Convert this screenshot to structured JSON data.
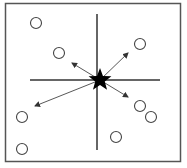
{
  "diagram": {
    "type": "radial-scatter",
    "frame": {
      "x": 5.5,
      "y": 3.5,
      "width": 175,
      "height": 158,
      "stroke": "#555555"
    },
    "axes": {
      "horizontal": {
        "x1": 30,
        "y1": 80,
        "x2": 160,
        "y2": 80
      },
      "vertical": {
        "x1": 97,
        "y1": 14,
        "x2": 97,
        "y2": 150
      },
      "stroke": "#333333"
    },
    "center": {
      "x": 100,
      "y": 80,
      "shape": "star-icon",
      "color": "#000000"
    },
    "points": [
      {
        "x": 36,
        "y": 23
      },
      {
        "x": 59,
        "y": 53
      },
      {
        "x": 140,
        "y": 44
      },
      {
        "x": 22,
        "y": 117
      },
      {
        "x": 22,
        "y": 149
      },
      {
        "x": 140,
        "y": 106
      },
      {
        "x": 151,
        "y": 117
      },
      {
        "x": 116,
        "y": 137
      }
    ],
    "arrows": [
      {
        "from": [
          100,
          80
        ],
        "to": [
          72,
          63
        ]
      },
      {
        "from": [
          100,
          80
        ],
        "to": [
          128,
          53
        ]
      },
      {
        "from": [
          100,
          80
        ],
        "to": [
          35,
          106
        ]
      },
      {
        "from": [
          100,
          80
        ],
        "to": [
          128,
          97
        ]
      }
    ],
    "point_radius": 5.5,
    "point_stroke": "#444444",
    "arrow_stroke": "#444444"
  }
}
